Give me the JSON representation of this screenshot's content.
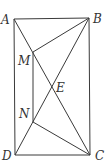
{
  "diagram": {
    "type": "geometry",
    "points": {
      "A": {
        "label": "A",
        "x": 14,
        "y": 19
      },
      "B": {
        "label": "B",
        "x": 89,
        "y": 18
      },
      "C": {
        "label": "C",
        "x": 90,
        "y": 155
      },
      "D": {
        "label": "D",
        "x": 15,
        "y": 155
      },
      "M": {
        "label": "M",
        "x": 33,
        "y": 52
      },
      "N": {
        "label": "N",
        "x": 33,
        "y": 122
      },
      "E": {
        "label": "E",
        "x": 52,
        "y": 86
      }
    },
    "segments": [
      [
        "A",
        "B"
      ],
      [
        "B",
        "C"
      ],
      [
        "C",
        "D"
      ],
      [
        "D",
        "A"
      ],
      [
        "A",
        "C"
      ],
      [
        "B",
        "D"
      ],
      [
        "B",
        "M"
      ],
      [
        "M",
        "N"
      ],
      [
        "N",
        "C"
      ]
    ],
    "colors": {
      "line": "#3a3a3a",
      "label": "#333333",
      "background": "#ffffff"
    }
  }
}
